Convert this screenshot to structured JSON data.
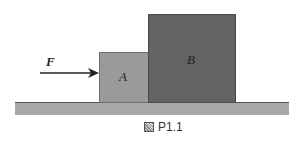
{
  "diagram": {
    "force_label": "F",
    "block_a_label": "A",
    "block_b_label": "B",
    "caption": "P1.1",
    "colors": {
      "block_a": "#9a9a9a",
      "block_b": "#636363",
      "ground": "#a8a8a8",
      "arrow": "#222222"
    }
  }
}
